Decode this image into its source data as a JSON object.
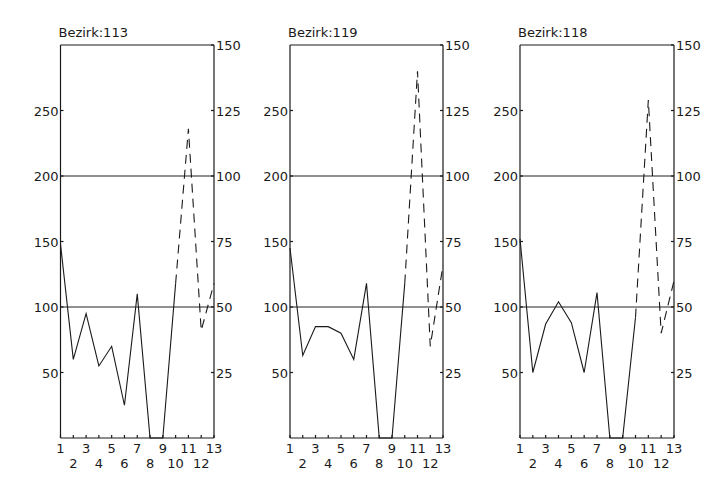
{
  "chart_data": [
    {
      "type": "line",
      "title": "Bezirk:113",
      "x": [
        1,
        2,
        3,
        4,
        5,
        6,
        7,
        8,
        9,
        10,
        11,
        12,
        13
      ],
      "left_axis": {
        "ticks": [
          50,
          100,
          150,
          200,
          250
        ],
        "range": [
          0,
          300
        ]
      },
      "right_axis": {
        "ticks": [
          25,
          50,
          75,
          100,
          125,
          150
        ],
        "range": [
          0,
          150
        ]
      },
      "reference_lines_left": [
        100,
        200
      ],
      "series": [
        {
          "name": "solid (left axis)",
          "style": "solid",
          "x": [
            1,
            2,
            3,
            4,
            5,
            6,
            7,
            8,
            9,
            10
          ],
          "values": [
            148,
            60,
            95,
            55,
            70,
            25,
            110,
            0,
            0,
            118
          ]
        },
        {
          "name": "dashed (right axis)",
          "style": "dashed",
          "x": [
            10,
            11,
            12,
            13
          ],
          "values": [
            59,
            118,
            41,
            59
          ]
        }
      ]
    },
    {
      "type": "line",
      "title": "Bezirk:119",
      "x": [
        1,
        2,
        3,
        4,
        5,
        6,
        7,
        8,
        9,
        10,
        11,
        12,
        13
      ],
      "left_axis": {
        "ticks": [
          50,
          100,
          150,
          200,
          250
        ],
        "range": [
          0,
          300
        ]
      },
      "right_axis": {
        "ticks": [
          25,
          50,
          75,
          100,
          125,
          150
        ],
        "range": [
          0,
          150
        ]
      },
      "reference_lines_left": [
        100,
        200
      ],
      "series": [
        {
          "name": "solid (left axis)",
          "style": "solid",
          "x": [
            1,
            2,
            3,
            4,
            5,
            6,
            7,
            8,
            9,
            10
          ],
          "values": [
            145,
            63,
            85,
            85,
            80,
            60,
            118,
            0,
            0,
            118
          ]
        },
        {
          "name": "dashed (right axis)",
          "style": "dashed",
          "x": [
            10,
            11,
            12,
            13
          ],
          "values": [
            59,
            140,
            35,
            66
          ]
        }
      ]
    },
    {
      "type": "line",
      "title": "Bezirk:118",
      "x": [
        1,
        2,
        3,
        4,
        5,
        6,
        7,
        8,
        9,
        10,
        11,
        12,
        13
      ],
      "left_axis": {
        "ticks": [
          50,
          100,
          150,
          200,
          250
        ],
        "range": [
          0,
          300
        ]
      },
      "right_axis": {
        "ticks": [
          25,
          50,
          75,
          100,
          125,
          150
        ],
        "range": [
          0,
          150
        ]
      },
      "reference_lines_left": [
        100,
        200
      ],
      "series": [
        {
          "name": "solid (left axis)",
          "style": "solid",
          "x": [
            1,
            2,
            3,
            4,
            5,
            6,
            7,
            8,
            9,
            10
          ],
          "values": [
            152,
            50,
            87,
            104,
            88,
            50,
            111,
            0,
            0,
            92
          ]
        },
        {
          "name": "dashed (right axis)",
          "style": "dashed",
          "x": [
            10,
            11,
            12,
            13
          ],
          "values": [
            46,
            129,
            40,
            60
          ]
        }
      ]
    }
  ],
  "panels": [
    {
      "title": "Bezirk:113",
      "left": 60.5,
      "right": 214
    },
    {
      "title": "Bezirk:119",
      "left": 290,
      "right": 443
    },
    {
      "title": "Bezirk:118",
      "left": 520,
      "right": 674
    }
  ],
  "layout": {
    "top": 45,
    "bottom": 438,
    "left_max": 300,
    "right_max": 150
  }
}
